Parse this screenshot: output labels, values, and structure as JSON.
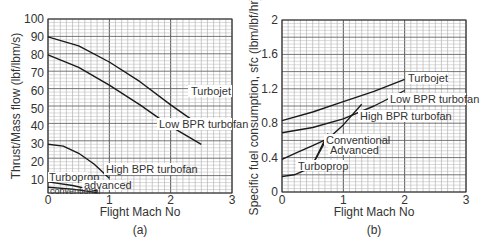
{
  "chart_data": [
    {
      "id": "a",
      "type": "line",
      "caption": "(a)",
      "xlabel": "Flight Mach No",
      "ylabel": "Thrust/Mass flow (lbf/lbm/s)",
      "xlim": [
        0,
        3
      ],
      "ylim": [
        0,
        100
      ],
      "xticks": [
        "0",
        "1",
        "2",
        "3"
      ],
      "yticks": [
        "10",
        "20",
        "30",
        "40",
        "50",
        "60",
        "70",
        "80",
        "90",
        "100"
      ],
      "grid": true,
      "series": [
        {
          "name": "Turbojet",
          "x": [
            0,
            0.5,
            1,
            1.5,
            2,
            2.5
          ],
          "y": [
            90,
            85,
            76,
            65,
            52,
            40
          ]
        },
        {
          "name": "Low BPR turbofan",
          "x": [
            0,
            0.5,
            1,
            1.5,
            2,
            2.5
          ],
          "y": [
            80,
            73,
            63,
            52,
            40,
            30
          ]
        },
        {
          "name": "High BPR turbofan",
          "x": [
            0,
            0.25,
            0.5,
            0.75,
            1
          ],
          "y": [
            30,
            29,
            25,
            19,
            11
          ]
        },
        {
          "name": "Turboprop advanced",
          "x": [
            0,
            0.4,
            0.8
          ],
          "y": [
            9,
            7,
            4
          ]
        },
        {
          "name": "Turboprop conventional",
          "x": [
            0,
            0.4,
            0.8
          ],
          "y": [
            6,
            5,
            3
          ]
        }
      ],
      "labels": {
        "turbojet": "Turbojet",
        "low_bpr": "Low BPR turbofan",
        "high_bpr": "High BPR turbofan",
        "turboprop": "Turboprop",
        "advanced": "advanced",
        "conventional": "conventional"
      }
    },
    {
      "id": "b",
      "type": "line",
      "caption": "(b)",
      "xlabel": "Flight Mach No",
      "ylabel": "Specific fuel consumption, sfc (lbm/lbf/hr)",
      "xlim": [
        0,
        3
      ],
      "ylim": [
        0,
        2
      ],
      "xticks": [
        "0",
        "1",
        "2",
        "3"
      ],
      "yticks": [
        "0",
        "0.4",
        "0.8",
        "1.2",
        "1.6",
        "2"
      ],
      "grid": true,
      "series": [
        {
          "name": "Turbojet",
          "x": [
            0,
            0.5,
            1,
            1.5,
            2
          ],
          "y": [
            0.83,
            0.93,
            1.05,
            1.17,
            1.31
          ]
        },
        {
          "name": "Low BPR turbofan",
          "x": [
            0,
            0.5,
            1,
            1.5,
            2
          ],
          "y": [
            0.69,
            0.75,
            0.85,
            1.0,
            1.18
          ]
        },
        {
          "name": "High BPR turbofan",
          "x": [
            0,
            0.25,
            0.5,
            0.75,
            1,
            1.3
          ],
          "y": [
            0.38,
            0.46,
            0.54,
            0.62,
            0.78,
            1.02
          ]
        },
        {
          "name": "Turboprop",
          "x": [
            0,
            0.2,
            0.4,
            0.5
          ],
          "y": [
            0.18,
            0.2,
            0.26,
            0.32
          ]
        },
        {
          "name": "Turboprop conventional",
          "x": [
            0.5,
            0.75
          ],
          "y": [
            0.32,
            0.68
          ]
        },
        {
          "name": "Turboprop advanced",
          "x": [
            0.5,
            0.7
          ],
          "y": [
            0.32,
            0.58
          ]
        }
      ],
      "labels": {
        "turbojet": "Turbojet",
        "low_bpr": "Low BPR turbofan",
        "high_bpr": "High BPR turbofan",
        "conventional": "Conventional",
        "advanced": "Advanced",
        "turboprop": "Turboprop"
      }
    }
  ]
}
